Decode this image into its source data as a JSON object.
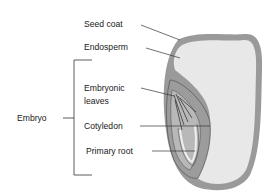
{
  "diagram": {
    "labels": {
      "seed_coat": "Seed coat",
      "endosperm": "Endosperm",
      "embryonic_leaves_line1": "Embryonic",
      "embryonic_leaves_line2": "leaves",
      "cotyledon": "Cotyledon",
      "primary_root": "Primary root",
      "embryo": "Embryo"
    },
    "colors": {
      "seed_coat": "#8c8c8c",
      "endosperm": "#e6e6e6",
      "embryo": "#9a9a9a",
      "embryo_dark": "#5a5a5a",
      "label_text": "#1a1a1a",
      "leader_line": "#333333"
    }
  }
}
